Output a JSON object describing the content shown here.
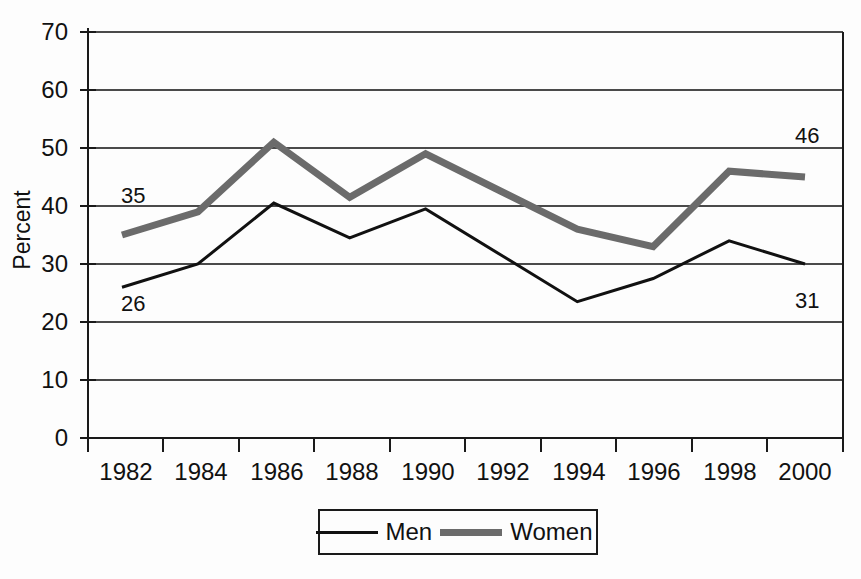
{
  "chart_data": {
    "type": "line",
    "title": "",
    "xlabel": "",
    "ylabel": "Percent",
    "ylim": [
      0,
      70
    ],
    "ytick_step": 10,
    "grid": true,
    "legend_position": "bottom-center",
    "categories": [
      "1982",
      "1984",
      "1986",
      "1988",
      "1990",
      "1992",
      "1994",
      "1996",
      "1998",
      "2000"
    ],
    "yticks": [
      "0",
      "10",
      "20",
      "30",
      "40",
      "50",
      "60",
      "70"
    ],
    "series": [
      {
        "name": "Men",
        "color": "#111111",
        "line_width": 3,
        "values": [
          26,
          30,
          40.5,
          34.5,
          39.5,
          31.5,
          23.5,
          27.5,
          34,
          30
        ]
      },
      {
        "name": "Women",
        "color": "#6b6b6b",
        "line_width": 7,
        "values": [
          35,
          39,
          51,
          41.5,
          49,
          42.5,
          36,
          33,
          46,
          45
        ]
      }
    ],
    "annotations": [
      {
        "text": "35",
        "series": "Women",
        "category": "1982",
        "value": 35
      },
      {
        "text": "26",
        "series": "Men",
        "category": "1982",
        "value": 26
      },
      {
        "text": "46",
        "series": "Women",
        "category": "2000",
        "value": 46
      },
      {
        "text": "31",
        "series": "Men",
        "category": "2000",
        "value": 31
      }
    ]
  },
  "axis": {
    "y_title": "Percent",
    "y_labels": [
      "70",
      "60",
      "50",
      "40",
      "30",
      "20",
      "10",
      "0"
    ],
    "x_labels": [
      "1982",
      "1984",
      "1986",
      "1988",
      "1990",
      "1992",
      "1994",
      "1996",
      "1998",
      "2000"
    ]
  },
  "labels": {
    "women_start": "35",
    "men_start": "26",
    "women_end": "46",
    "men_end": "31"
  },
  "legend": {
    "men_label": "Men",
    "women_label": "Women"
  },
  "colors": {
    "men_line": "#111111",
    "women_line": "#6b6b6b",
    "grid": "#4a4a4a",
    "axis": "#1a1a1a",
    "background": "#fdfdfd"
  }
}
